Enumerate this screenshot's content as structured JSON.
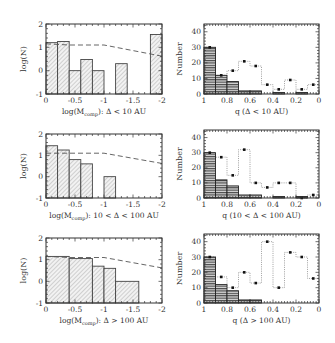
{
  "chart_data": [
    {
      "type": "bar",
      "panel": "row1-left",
      "title": "",
      "xlabel": "log(M_comp): Δ < 10 AU",
      "ylabel": "log(N)",
      "xlim": [
        0,
        -2
      ],
      "ylim": [
        -1,
        2
      ],
      "xticks": [
        "0",
        "-0.5",
        "-1",
        "-1.5",
        "-2"
      ],
      "yticks": [
        "-1",
        "0",
        "1",
        "2"
      ],
      "histogram": {
        "style": "hatched-fill",
        "bins": [
          {
            "x0": 0,
            "x1": -0.2,
            "y": 1.2
          },
          {
            "x0": -0.2,
            "x1": -0.4,
            "y": 1.25
          },
          {
            "x0": -0.4,
            "x1": -0.6,
            "y": 0
          },
          {
            "x0": -0.6,
            "x1": -0.8,
            "y": 0.48
          },
          {
            "x0": -0.8,
            "x1": -1.0,
            "y": 0
          },
          {
            "x0": -1.2,
            "x1": -1.4,
            "y": 0.3
          },
          {
            "x0": -1.8,
            "x1": -2.0,
            "y": 1.55
          }
        ]
      },
      "dashed_line": {
        "x": [
          0,
          -0.4,
          -1.0,
          -2.0
        ],
        "y": [
          1.15,
          1.1,
          1.1,
          0.62
        ]
      }
    },
    {
      "type": "bar",
      "panel": "row1-right",
      "xlabel": "q (Δ < 10 AU)",
      "ylabel": "Number",
      "xlim": [
        1,
        0
      ],
      "ylim": [
        0,
        45
      ],
      "xticks": [
        "1",
        "0.8",
        "0.6",
        "0.4",
        "0.2",
        "0"
      ],
      "yticks": [
        "0",
        "10",
        "20",
        "30",
        "40"
      ],
      "filled_histogram": {
        "style": "horizontal-hatched-dark",
        "bins": [
          {
            "x0": 1.0,
            "x1": 0.9,
            "y": 30
          },
          {
            "x0": 0.9,
            "x1": 0.8,
            "y": 12
          },
          {
            "x0": 0.8,
            "x1": 0.7,
            "y": 8
          },
          {
            "x0": 0.7,
            "x1": 0.6,
            "y": 2
          },
          {
            "x0": 0.6,
            "x1": 0.5,
            "y": 2
          },
          {
            "x0": 0.4,
            "x1": 0.3,
            "y": 1
          },
          {
            "x0": 0.2,
            "x1": 0.1,
            "y": 1
          }
        ]
      },
      "dotted_histogram": {
        "centers": [
          0.95,
          0.85,
          0.75,
          0.65,
          0.55,
          0.45,
          0.35,
          0.25,
          0.15,
          0.05
        ],
        "values": [
          30,
          12,
          15,
          21,
          18,
          6,
          3,
          9,
          3,
          6
        ]
      }
    },
    {
      "type": "bar",
      "panel": "row2-left",
      "xlabel": "log(M_comp): 10 < Δ < 100 AU",
      "ylabel": "log(N)",
      "xlim": [
        0,
        -2
      ],
      "ylim": [
        -1,
        2
      ],
      "xticks": [
        "0",
        "-0.5",
        "-1",
        "-1.5",
        "-2"
      ],
      "yticks": [
        "-1",
        "0",
        "1",
        "2"
      ],
      "histogram": {
        "style": "hatched-fill",
        "bins": [
          {
            "x0": 0,
            "x1": -0.2,
            "y": 1.45
          },
          {
            "x0": -0.2,
            "x1": -0.4,
            "y": 1.25
          },
          {
            "x0": -0.4,
            "x1": -0.6,
            "y": 0.8
          },
          {
            "x0": -0.6,
            "x1": -0.8,
            "y": 0.6
          },
          {
            "x0": -1.0,
            "x1": -1.2,
            "y": 0
          }
        ]
      },
      "dashed_line": {
        "x": [
          0,
          -0.4,
          -1.0,
          -2.0
        ],
        "y": [
          1.1,
          1.1,
          1.1,
          0.62
        ]
      }
    },
    {
      "type": "bar",
      "panel": "row2-right",
      "xlabel": "q (10 < Δ < 100 AU)",
      "ylabel": "Number",
      "xlim": [
        1,
        0
      ],
      "ylim": [
        0,
        45
      ],
      "xticks": [
        "1",
        "0.8",
        "0.6",
        "0.4",
        "0.2",
        "0"
      ],
      "yticks": [
        "0",
        "10",
        "20",
        "30",
        "40"
      ],
      "filled_histogram": {
        "style": "horizontal-hatched-dark",
        "bins": [
          {
            "x0": 1.0,
            "x1": 0.9,
            "y": 30
          },
          {
            "x0": 0.9,
            "x1": 0.8,
            "y": 12
          },
          {
            "x0": 0.8,
            "x1": 0.7,
            "y": 8
          },
          {
            "x0": 0.7,
            "x1": 0.6,
            "y": 2
          },
          {
            "x0": 0.6,
            "x1": 0.5,
            "y": 2
          },
          {
            "x0": 0.4,
            "x1": 0.3,
            "y": 1
          },
          {
            "x0": 0.2,
            "x1": 0.1,
            "y": 1
          }
        ]
      },
      "dotted_histogram": {
        "centers": [
          0.95,
          0.85,
          0.75,
          0.65,
          0.55,
          0.45,
          0.35,
          0.25,
          0.15,
          0.05
        ],
        "values": [
          30,
          27,
          15,
          32,
          10,
          7,
          10,
          10,
          0,
          2
        ]
      }
    },
    {
      "type": "bar",
      "panel": "row3-left",
      "xlabel": "log(M_comp): Δ > 100 AU",
      "ylabel": "log(N)",
      "xlim": [
        0,
        -2
      ],
      "ylim": [
        -1,
        2
      ],
      "xticks": [
        "0",
        "-0.5",
        "-1",
        "-1.5",
        "-2"
      ],
      "yticks": [
        "-1",
        "0",
        "1",
        "2"
      ],
      "histogram": {
        "style": "hatched-fill",
        "bins": [
          {
            "x0": 0,
            "x1": -0.4,
            "y": 1.15
          },
          {
            "x0": -0.4,
            "x1": -0.8,
            "y": 1.05
          },
          {
            "x0": -0.8,
            "x1": -1.0,
            "y": 0.7
          },
          {
            "x0": -1.0,
            "x1": -1.2,
            "y": 0.6
          },
          {
            "x0": -1.2,
            "x1": -1.6,
            "y": 0
          }
        ]
      },
      "dashed_line": {
        "x": [
          0,
          -0.4,
          -1.0,
          -2.0
        ],
        "y": [
          1.15,
          1.1,
          1.1,
          0.62
        ]
      }
    },
    {
      "type": "bar",
      "panel": "row3-right",
      "xlabel": "q (Δ > 100 AU)",
      "ylabel": "Number",
      "xlim": [
        1,
        0
      ],
      "ylim": [
        0,
        45
      ],
      "xticks": [
        "1",
        "0.8",
        "0.6",
        "0.4",
        "0.2",
        "0"
      ],
      "yticks": [
        "0",
        "10",
        "20",
        "30",
        "40"
      ],
      "filled_histogram": {
        "style": "horizontal-hatched-dark",
        "bins": [
          {
            "x0": 1.0,
            "x1": 0.9,
            "y": 30
          },
          {
            "x0": 0.9,
            "x1": 0.8,
            "y": 12
          },
          {
            "x0": 0.8,
            "x1": 0.7,
            "y": 8
          },
          {
            "x0": 0.7,
            "x1": 0.6,
            "y": 2
          },
          {
            "x0": 0.6,
            "x1": 0.5,
            "y": 2
          }
        ]
      },
      "dotted_histogram": {
        "centers": [
          0.95,
          0.85,
          0.75,
          0.65,
          0.55,
          0.45,
          0.35,
          0.25,
          0.15,
          0.05
        ],
        "values": [
          30,
          17,
          10,
          20,
          13,
          40,
          10,
          33,
          30,
          16
        ]
      }
    }
  ],
  "labels": {
    "left_ylabel": "log(N)",
    "right_ylabel": "Number",
    "left_xlabels": [
      "log(M",
      "log(M",
      "log(M"
    ],
    "left_xlabel_sub": "comp",
    "left_xlabel_suffix": [
      "): Δ < 10 AU",
      "): 10 < Δ < 100 AU",
      "): Δ > 100 AU"
    ],
    "right_xlabels": [
      "q (Δ < 10 AU)",
      "q (10 < Δ < 100 AU)",
      "q (Δ > 100 AU)"
    ],
    "left_xticks": [
      "0",
      "-0.5",
      "-1",
      "-1.5",
      "-2"
    ],
    "left_yticks": [
      "2",
      "1",
      "0",
      "-1"
    ],
    "right_xticks": [
      "1",
      "0.8",
      "0.6",
      "0.4",
      "0.2",
      "0"
    ],
    "right_yticks": [
      "40",
      "30",
      "20",
      "10",
      "0"
    ]
  }
}
